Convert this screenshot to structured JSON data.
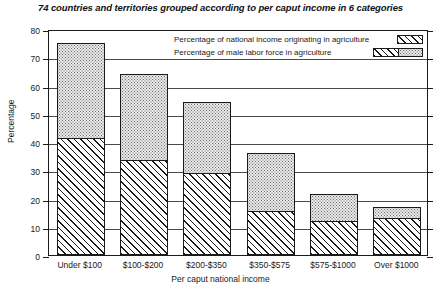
{
  "chart_data": {
    "type": "bar",
    "title": "74 countries and territories grouped according to per caput income in 6 categories",
    "xlabel": "Per caput national income",
    "ylabel": "Percentage",
    "ylim": [
      0,
      80
    ],
    "yticks": [
      0,
      10,
      20,
      30,
      40,
      50,
      60,
      70,
      80
    ],
    "grid": true,
    "stacked": true,
    "legend_position": "top-right-inside",
    "categories": [
      "Under $100",
      "$100-$200",
      "$200-$350",
      "$350-$575",
      "$575-$1000",
      "Over $1000"
    ],
    "series": [
      {
        "name": "Percentage of national income originating in agriculture",
        "pattern": "diagonal-hatch",
        "values": [
          41.5,
          33.5,
          29,
          15.5,
          12,
          13
        ]
      },
      {
        "name": "Percentage of male labor force in agriculture",
        "pattern": "stipple-dots",
        "values": [
          75,
          64,
          54,
          36,
          21.5,
          17
        ]
      }
    ]
  },
  "legend": {
    "items": [
      {
        "label": "Percentage of national income originating in agriculture",
        "swatch": "hatch-swatch"
      },
      {
        "label": "Percentage of male labor force in agriculture",
        "swatch": "hatch-dot-swatch"
      }
    ]
  }
}
